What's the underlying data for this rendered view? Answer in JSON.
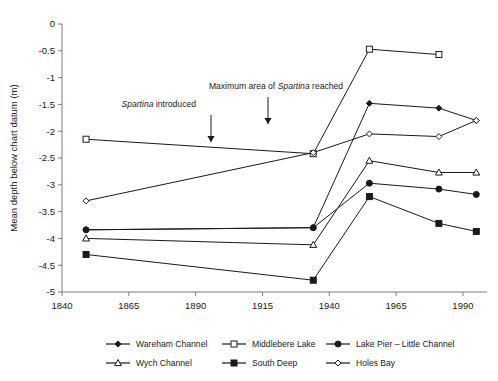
{
  "chart_data": {
    "type": "line",
    "title": "",
    "xlabel": "",
    "ylabel": "Mean depth below chart datum (m)",
    "xlim": [
      1840,
      1999
    ],
    "ylim": [
      -5,
      0
    ],
    "xticks": [
      1840,
      1865,
      1890,
      1915,
      1940,
      1965,
      1990
    ],
    "yticks": [
      0,
      -0.5,
      -1,
      -1.5,
      -2,
      -2.5,
      -3,
      -3.5,
      -4,
      -4.5,
      -5
    ],
    "ytick_labels": [
      "0",
      "-0.5",
      "-1",
      "-1.5",
      "-2",
      "-2.5",
      "-3",
      "-3.5",
      "-4",
      "-4.5",
      "-5"
    ],
    "xtick_labels": [
      "1840",
      "1865",
      "1890",
      "1915",
      "1940",
      "1965",
      "1990"
    ],
    "grid": false,
    "legend_position": "bottom",
    "x": [
      1849,
      1934,
      1955,
      1981,
      1995
    ],
    "series": [
      {
        "name": "Wareham Channel",
        "marker": "filled-diamond",
        "x": [
          1849,
          1934,
          1955,
          1981,
          1995
        ],
        "values": [
          -3.84,
          -3.8,
          -1.48,
          -1.57,
          -1.8
        ]
      },
      {
        "name": "Middlebere Lake",
        "marker": "open-square",
        "x": [
          1849,
          1934,
          1955,
          1981
        ],
        "values": [
          -2.15,
          -2.42,
          -0.47,
          -0.57
        ]
      },
      {
        "name": "Lake Pier – Little Channel",
        "marker": "filled-circle",
        "x": [
          1849,
          1934,
          1955,
          1981,
          1995
        ],
        "values": [
          -3.84,
          -3.8,
          -2.97,
          -3.08,
          -3.18
        ]
      },
      {
        "name": "Wych Channel",
        "marker": "open-triangle",
        "x": [
          1849,
          1934,
          1955,
          1981,
          1995
        ],
        "values": [
          -4.0,
          -4.12,
          -2.55,
          -2.77,
          -2.77
        ]
      },
      {
        "name": "South Deep",
        "marker": "filled-square",
        "x": [
          1849,
          1934,
          1955,
          1981,
          1995
        ],
        "values": [
          -4.3,
          -4.78,
          -3.22,
          -3.72,
          -3.87
        ]
      },
      {
        "name": "Holes Bay",
        "marker": "open-diamond",
        "x": [
          1849,
          1934,
          1955,
          1981,
          1995
        ],
        "values": [
          -3.3,
          -2.4,
          -2.05,
          -2.1,
          -1.8
        ]
      }
    ],
    "annotations": [
      {
        "text_plain": "Spartina introduced",
        "italic_part": "Spartina",
        "rest": " introduced",
        "x": 1890,
        "arrow": true
      },
      {
        "text_plain": "Maximum area of Spartina reached",
        "prefix": "Maximum area of ",
        "italic_part": "Spartina",
        "rest": " reached",
        "x": 1920,
        "arrow": true
      }
    ],
    "colors": {
      "line": "#1a1a1a",
      "axis": "#7d7d7d",
      "text": "#1a1a1a",
      "background": "#ffffff"
    }
  },
  "legend": {
    "items": [
      {
        "label": "Wareham Channel",
        "marker": "filled-diamond"
      },
      {
        "label": "Middlebere Lake",
        "marker": "open-square"
      },
      {
        "label": "Lake Pier – Little Channel",
        "marker": "filled-circle"
      },
      {
        "label": "Wych Channel",
        "marker": "open-triangle"
      },
      {
        "label": "South Deep",
        "marker": "filled-square"
      },
      {
        "label": "Holes Bay",
        "marker": "open-diamond"
      }
    ]
  }
}
